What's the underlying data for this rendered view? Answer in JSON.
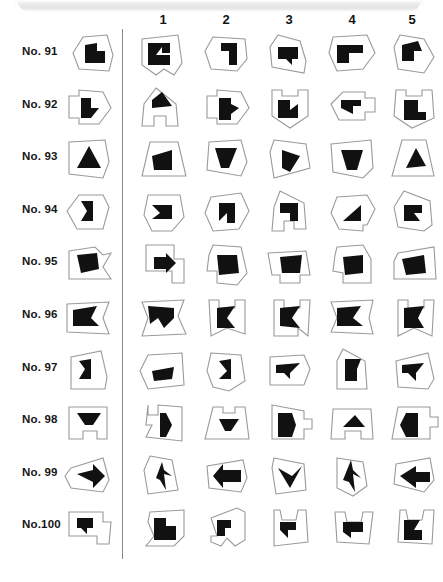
{
  "sheet": {
    "type": "mental-rotation-test",
    "column_headers": [
      "1",
      "2",
      "3",
      "4",
      "5"
    ],
    "row_labels": [
      "No. 91",
      "No. 92",
      "No. 93",
      "No. 94",
      "No. 95",
      "No. 96",
      "No. 97",
      "No. 98",
      "No. 99",
      "No.100"
    ],
    "colors": {
      "figure_fill": "#111111",
      "outline_stroke": "#9a9a9a",
      "banner": "#e6e6e6",
      "text": "#161616",
      "page_background": "#ffffff"
    },
    "columns_per_row": 5,
    "reference_column_present": true
  },
  "chart_data": {
    "type": "table",
    "title": "",
    "categories": [
      "ref",
      "1",
      "2",
      "3",
      "4",
      "5"
    ],
    "rows": [
      {
        "label": "No. 91",
        "ref": {
          "outline": "24,8 48,6 54,26 50,42 20,40 14,24",
          "fig": "26,16 38,14 38,22 46,22 46,34 26,34"
        },
        "options": [
          {
            "outline": "8,10 44,6 48,34 40,46 30,40 22,46 8,36",
            "fig": "14,14 36,14 36,24 28,24 28,18 22,26 36,26 36,36 14,36"
          },
          {
            "outline": "16,8 48,10 50,30 40,42 14,40 8,22",
            "fig": "24,14 40,14 40,36 32,36 32,22 24,22"
          },
          {
            "outline": "18,6 40,12 46,32 44,44 12,38 10,18",
            "fig": "18,18 38,18 38,30 32,30 32,36 26,30 18,30"
          },
          {
            "outline": "10,8 44,6 52,24 40,40 14,42 6,24",
            "fig": "14,16 40,16 40,24 26,24 26,34 14,34"
          },
          {
            "outline": "16,6 40,10 50,28 40,44 14,40 10,18",
            "fig": "18,16 34,12 38,22 30,22 30,32 18,32"
          }
        ]
      },
      {
        "label": "No. 92",
        "ref": {
          "outline": "10,14 20,14 20,8 44,10 52,26 40,42 20,42 20,36 10,36",
          "fig": "22,16 32,16 32,26 40,26 32,36 22,36"
        },
        "options": [
          {
            "outline": "22,6 42,22 44,44 32,44 32,34 20,34 20,44 8,44 10,22",
            "fig": "18,18 28,10 38,24 18,26"
          },
          {
            "outline": "10,14 20,14 20,8 44,10 52,26 40,42 20,42 20,36 10,36",
            "fig": "22,16 34,16 34,22 42,26 34,32 34,38 22,38"
          },
          {
            "outline": "12,8 22,8 22,14 38,14 38,8 48,8 48,34 30,46 12,34",
            "fig": "18,18 30,18 30,28 38,22 38,36 18,36"
          },
          {
            "outline": "8,22 20,10 42,10 42,16 52,16 52,30 42,30 42,38 16,38",
            "fig": "18,18 38,18 38,24 30,24 30,32 18,26"
          },
          {
            "outline": "12,8 22,8 22,14 38,14 38,8 48,8 50,36 28,46 10,34",
            "fig": "20,18 34,18 34,30 42,30 42,38 20,38"
          }
        ]
      },
      {
        "label": "No. 93",
        "ref": {
          "outline": "10,8 46,6 50,28 44,44 10,40",
          "fig": "18,34 30,12 42,34"
        },
        "options": [
          {
            "outline": "16,8 44,8 52,42 8,42",
            "fig": "18,22 38,16 38,36 20,36"
          },
          {
            "outline": "12,8 44,6 50,28 44,42 10,36",
            "fig": "18,14 40,14 32,34 24,34"
          },
          {
            "outline": "14,6 46,10 50,34 14,44 10,18",
            "fig": "22,16 40,22 30,38 22,34"
          },
          {
            "outline": "8,10 48,6 50,34 40,44 10,38",
            "fig": "18,16 40,16 34,36 24,36"
          },
          {
            "outline": "18,6 42,6 50,42 8,42",
            "fig": "22,34 32,14 42,32"
          }
        ]
      },
      {
        "label": "No. 94",
        "ref": {
          "outline": "20,8 44,8 50,20 44,42 18,42 8,24",
          "fig": "22,14 34,14 34,34 22,34 28,24"
        },
        "options": [
          {
            "outline": "14,8 46,8 50,30 38,44 18,44 10,28",
            "fig": "18,18 38,18 38,32 18,32 26,26"
          },
          {
            "outline": "14,10 44,6 52,24 42,42 16,44 8,26",
            "fig": "22,16 38,16 38,36 30,36 30,26 22,34"
          },
          {
            "outline": "20,4 44,16 46,42 34,42 34,34 24,34 24,44 12,44 14,20",
            "fig": "20,16 38,16 38,34 30,34 30,26 20,26"
          },
          {
            "outline": "14,10 44,8 52,22 44,38 40,38 40,44 16,42 8,26",
            "fig": "20,34 38,18 38,34"
          },
          {
            "outline": "20,4 46,14 48,38 40,44 14,40 10,20",
            "fig": "20,18 38,18 38,26 30,26 36,34 20,34"
          }
        ]
      },
      {
        "label": "No. 95",
        "ref": {
          "outline": "10,12 36,8 44,16 52,14 44,28 52,40 10,40",
          "fig": "18,16 38,14 40,30 22,34"
        },
        "options": [
          {
            "outline": "12,6 40,6 40,20 50,20 50,44 38,44 38,32 12,32",
            "fig": "20,18 32,18 32,14 42,24 32,34 32,30 20,30"
          },
          {
            "outline": "16,6 44,8 50,34 40,46 20,44 20,32 10,32 12,16",
            "fig": "20,16 40,16 42,34 22,36"
          },
          {
            "outline": "8,14 46,12 50,36 40,36 40,44 20,44 20,36 12,36",
            "fig": "20,18 42,16 40,34 22,34"
          },
          {
            "outline": "14,8 40,6 48,20 48,44 20,44 20,34 10,32 12,16",
            "fig": "20,18 40,16 40,34 22,36"
          },
          {
            "outline": "14,14 50,8 52,40 10,40 10,22",
            "fig": "18,20 40,16 42,34 22,36"
          }
        ]
      },
      {
        "label": "No. 96",
        "ref": {
          "outline": "8,12 50,10 44,26 50,42 8,40",
          "fig": "14,18 38,14 32,26 40,34 14,34"
        },
        "options": [
          {
            "outline": "8,10 50,8 44,24 52,42 8,44 14,26",
            "fig": "14,14 40,16 40,26 30,36 24,26 16,32"
          },
          {
            "outline": "12,8 22,8 22,16 38,16 38,8 48,8 48,42 30,36 14,44",
            "fig": "20,16 38,14 30,26 38,36 20,36"
          },
          {
            "outline": "14,8 24,8 24,16 40,16 40,8 50,8 48,44 38,36 38,44 14,44",
            "fig": "20,16 40,14 32,26 40,36 20,34"
          },
          {
            "outline": "8,10 50,8 46,26 50,42 8,40 14,26",
            "fig": "14,16 38,14 30,26 40,34 14,34"
          },
          {
            "outline": "14,8 24,8 24,16 40,16 40,8 50,8 48,44 30,36 14,44",
            "fig": "20,16 40,14 34,26 40,36 20,36"
          }
        ]
      },
      {
        "label": "No. 97",
        "ref": {
          "outline": "12,12 42,6 48,32 46,44 12,44",
          "fig": "20,16 32,14 32,34 20,34 26,24"
        },
        "options": [
          {
            "outline": "14,10 48,8 50,40 14,44 6,26",
            "fig": "18,26 40,22 38,34 20,36"
          },
          {
            "outline": "14,8 44,10 48,36 32,46 16,42 10,26",
            "fig": "22,16 34,14 34,34 22,34 30,26"
          },
          {
            "outline": "10,12 44,10 50,24 44,40 10,40",
            "fig": "16,20 40,18 30,28 30,34 24,28 16,28"
          },
          {
            "outline": "20,4 42,16 44,44 14,44 14,16",
            "fig": "22,14 38,14 34,24 34,36 22,36"
          },
          {
            "outline": "12,16 44,8 50,34 44,44 14,42",
            "fig": "18,20 40,18 32,28 32,36 24,28 18,28"
          }
        ]
      },
      {
        "label": "No. 98",
        "ref": {
          "outline": "10,10 48,10 48,42 38,42 38,34 24,34 24,42 10,42",
          "fig": "18,16 42,16 34,28 26,28"
        },
        "options": [
          {
            "outline": "14,8 14,18 24,18 24,8 48,10 48,44 12,40 18,28 12,28",
            "fig": "26,16 32,16 38,28 32,40 26,40"
          },
          {
            "outline": "16,10 26,10 26,16 38,16 38,10 48,10 52,42 8,42",
            "fig": "22,22 42,22 34,34 28,34"
          },
          {
            "outline": "12,8 44,14 44,22 52,22 52,32 44,32 44,42 12,42",
            "fig": "18,16 32,16 36,28 32,40 18,40"
          },
          {
            "outline": "10,12 48,12 50,42 38,42 38,34 22,34 22,42 8,42",
            "fig": "20,30 32,18 42,30"
          },
          {
            "outline": "14,10 46,10 46,20 54,20 54,30 46,30 46,42 8,42",
            "fig": "22,16 34,16 34,40 22,40 16,28"
          }
        ]
      },
      {
        "label": "No. 99",
        "ref": {
          "outline": "12,18 44,8 50,30 44,42 12,38 6,26",
          "fig": "18,24 34,20 34,14 46,26 34,38 34,32"
        },
        "options": [
          {
            "outline": "16,6 38,10 44,40 14,44 10,20",
            "fig": "22,28 28,12 30,20 38,26 30,24 32,40 26,30"
          },
          {
            "outline": "10,16 46,10 50,28 44,42 12,38",
            "fig": "16,26 26,14 26,20 44,20 44,32 26,32 26,38"
          },
          {
            "outline": "14,8 44,14 46,40 16,44 12,18",
            "fig": "18,18 30,38 42,16 32,26"
          },
          {
            "outline": "14,8 40,12 44,36 30,46 14,38",
            "fig": "20,30 28,10 30,20 38,28 30,24 32,42 26,32"
          },
          {
            "outline": "12,14 46,8 50,30 40,42 10,34",
            "fig": "16,26 32,16 32,22 46,22 46,32 32,32 32,38"
          }
        ]
      },
      {
        "label": "No.100",
        "ref": {
          "outline": "10,10 44,10 44,20 52,20 50,42 38,42 38,34 10,34",
          "fig": "18,16 34,16 34,26 28,26 28,32 22,26 18,26"
        },
        "options": [
          {
            "outline": "16,10 50,8 50,34 40,44 12,44 20,34 14,20",
            "fig": "20,16 32,16 32,24 42,24 42,38 20,38"
          },
          {
            "outline": "14,16 40,6 48,10 48,38 38,44 30,36 24,44 14,40 14,34 20,34",
            "fig": "20,18 34,18 34,26 28,26 28,34 20,34"
          },
          {
            "outline": "14,8 20,8 22,18 36,18 38,8 46,8 48,40 14,44",
            "fig": "20,20 36,20 36,28 28,28 28,36 20,28"
          },
          {
            "outline": "12,10 22,10 24,20 38,20 40,10 50,10 46,42 14,40",
            "fig": "20,20 40,20 40,30 28,30 28,36 20,30"
          },
          {
            "outline": "16,8 22,8 24,18 38,18 40,8 50,8 48,42 14,40",
            "fig": "20,18 36,18 30,28 38,28 38,38 20,38"
          }
        ]
      }
    ]
  }
}
